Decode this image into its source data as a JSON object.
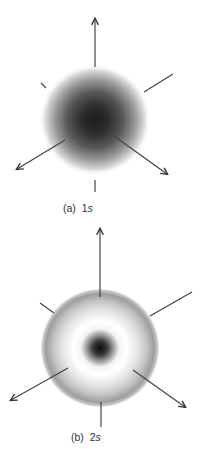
{
  "figure": {
    "panels": [
      {
        "id": "a",
        "label_prefix": "(a)",
        "orbital_number": "1",
        "orbital_letter": "s",
        "description": "1s orbital electron density, densest at the nucleus and fading outward",
        "colors": {
          "core": "#1a1a1a",
          "mid": "#7a7a7a",
          "edge": "#ffffff"
        }
      },
      {
        "id": "b",
        "label_prefix": "(b)",
        "orbital_number": "2",
        "orbital_letter": "s",
        "description": "2s orbital: dark inner core, white node, grey outer shell",
        "colors": {
          "core": "#111111",
          "node": "#ffffff",
          "shell": "#9a9a9a",
          "edge": "#ffffff"
        }
      }
    ],
    "line_color": "#444444"
  }
}
